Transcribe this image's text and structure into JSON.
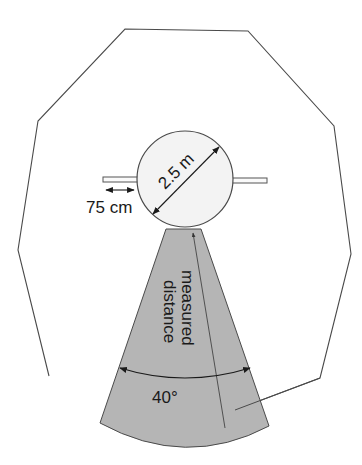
{
  "diagram": {
    "type": "sensor-coverage-schematic",
    "labels": {
      "diameter": "2.5 m",
      "bar_length": "75 cm",
      "measured_line_1": "measured",
      "measured_line_2": "distance",
      "angle": "40°"
    },
    "colors": {
      "outline": "#4a4a4a",
      "sector_fill": "#b5b5b5",
      "circle_fill": "#f3f3f3",
      "text": "#1a1a1a"
    },
    "shapes": {
      "room_outline": "irregular octagon-like polyline enclosing the scene",
      "central_circle": "circle of diameter 2.5 m with horizontal bars on both sides",
      "coverage_sector": "gray 40° sector fanning downward from the circle"
    }
  }
}
